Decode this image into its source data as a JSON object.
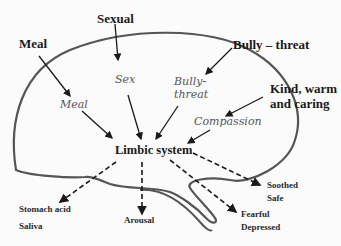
{
  "diagram": {
    "colors": {
      "outline": "#555555",
      "arrow": "#1a1a1a",
      "inner_text": "#555555"
    },
    "external_stimuli": [
      {
        "id": "meal",
        "label": "Meal"
      },
      {
        "id": "sexual",
        "label": "Sexual"
      },
      {
        "id": "bully",
        "label": "Bully – threat"
      },
      {
        "id": "kind",
        "label": "Kind, warm",
        "label2": "and caring"
      }
    ],
    "internal_representations": [
      {
        "id": "meal",
        "label": "Meal"
      },
      {
        "id": "sex",
        "label": "Sex"
      },
      {
        "id": "bully",
        "label": "Bully-",
        "label2": "threat"
      },
      {
        "id": "compassion",
        "label": "Compassion"
      }
    ],
    "center": {
      "label": "Limbic system"
    },
    "outputs": [
      {
        "id": "stomach",
        "label": "Stomach acid",
        "label2": "Saliva"
      },
      {
        "id": "arousal",
        "label": "Arousal"
      },
      {
        "id": "fearful",
        "label": "Fearful",
        "label2": "Depressed"
      },
      {
        "id": "soothed",
        "label": "Soothed",
        "label2": "Safe"
      }
    ]
  }
}
